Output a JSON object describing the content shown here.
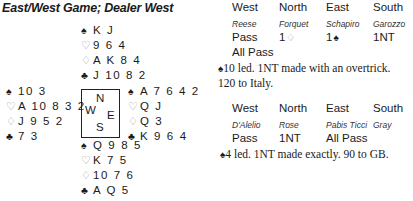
{
  "title": "East/West Game; Dealer West",
  "hands": {
    "north": {
      "spades": "K J",
      "hearts": "9 6 4",
      "diamonds": "A K 8 4",
      "clubs": "J 10 8 2"
    },
    "west": {
      "spades": "10 3",
      "hearts": "A 10 8 3 2",
      "diamonds": "J 9 5 2",
      "clubs": "7 3"
    },
    "east": {
      "spades": "A 7 6 4 2",
      "hearts": "Q J",
      "diamonds": "Q 3",
      "clubs": "K 9 6 4"
    },
    "south": {
      "spades": "Q 9 8 5",
      "hearts": "K 7 5",
      "diamonds": "10 7 6",
      "clubs": "A Q 5"
    }
  },
  "suit_icons": {
    "spades": "♠",
    "hearts": "♡",
    "diamonds": "♢",
    "clubs": "♣"
  },
  "compass": {
    "n": "N",
    "w": "W",
    "e": "E",
    "s": "S"
  },
  "auction1": {
    "headers": [
      "West",
      "North",
      "East",
      "South"
    ],
    "players": [
      "Reese",
      "Forquet",
      "Schapiro",
      "Garozzo"
    ],
    "row1": [
      "Pass",
      "1",
      "1",
      "1NT"
    ],
    "row2": [
      "All Pass"
    ],
    "note_line1": "10 led. 1NT made with an overtrick.",
    "note_line2": "120 to Italy."
  },
  "auction2": {
    "headers": [
      "West",
      "North",
      "East",
      "South"
    ],
    "players": [
      "D'Alelio",
      "Rose",
      "Pabis Ticci",
      "Gray"
    ],
    "row1": [
      "Pass",
      "1NT",
      "All Pass"
    ],
    "note_line1": "4 led. 1NT made exactly. 90 to GB."
  }
}
